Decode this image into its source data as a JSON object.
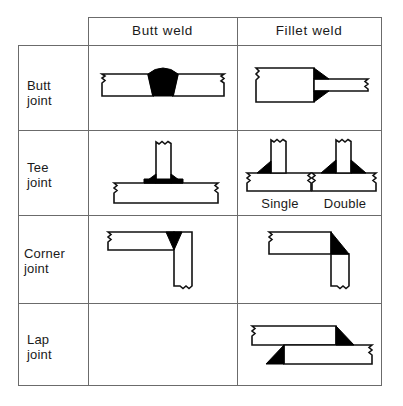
{
  "diagram": {
    "type": "table-matrix",
    "line_color": "#6b6b6b",
    "outline_color": "#111111",
    "weld_fill_color": "#000000",
    "plate_fill_color": "#ffffff",
    "columns": [
      {
        "id": "butt-weld",
        "label": "Butt  weld"
      },
      {
        "id": "fillet-weld",
        "label": "Fillet  weld"
      }
    ],
    "rows": [
      {
        "id": "butt-joint",
        "label": "Butt\njoint"
      },
      {
        "id": "tee-joint",
        "label": "Tee\njoint"
      },
      {
        "id": "corner-joint",
        "label": "Corner\njoint"
      },
      {
        "id": "lap-joint",
        "label": "Lap\njoint"
      }
    ],
    "sublabels": [
      {
        "id": "tee-fillet-single",
        "label": "Single"
      },
      {
        "id": "tee-fillet-double",
        "label": "Double"
      }
    ],
    "cells": [
      {
        "row": "butt-joint",
        "column": "butt-weld",
        "figure": "v-groove-butt-weld",
        "empty": false
      },
      {
        "row": "butt-joint",
        "column": "fillet-weld",
        "figure": "butt-joint-fillet-weld",
        "empty": false
      },
      {
        "row": "tee-joint",
        "column": "butt-weld",
        "figure": "tee-joint-butt-weld",
        "empty": false
      },
      {
        "row": "tee-joint",
        "column": "fillet-weld",
        "figure": "tee-joint-fillet-welds",
        "empty": false
      },
      {
        "row": "corner-joint",
        "column": "butt-weld",
        "figure": "corner-joint-butt-weld",
        "empty": false
      },
      {
        "row": "corner-joint",
        "column": "fillet-weld",
        "figure": "corner-joint-fillet-weld",
        "empty": false
      },
      {
        "row": "lap-joint",
        "column": "butt-weld",
        "figure": null,
        "empty": true
      },
      {
        "row": "lap-joint",
        "column": "fillet-weld",
        "figure": "lap-joint-fillet-weld",
        "empty": false
      }
    ]
  }
}
